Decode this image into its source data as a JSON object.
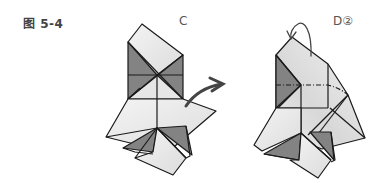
{
  "figure": {
    "caption": "图 5-4",
    "steps": [
      {
        "id": "C",
        "label": "C",
        "action": "fold flap outward (arrow right)"
      },
      {
        "id": "D",
        "label": "D②",
        "action": "fold top back (curved arrow)"
      }
    ]
  },
  "colors": {
    "paper_light": "#ececec",
    "paper_shade": "#8a8a8a",
    "line": "#1a1a1a",
    "arrow": "#444444",
    "text": "#444444"
  }
}
